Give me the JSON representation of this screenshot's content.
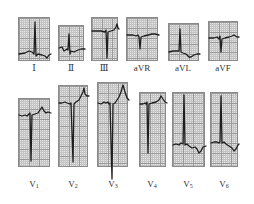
{
  "figure": {
    "title": "",
    "colors": {
      "background": "#ffffff",
      "grid_paper": "#e4e4e4",
      "grid_major": "#9a9a9a",
      "trace": "#1e1e1e",
      "label": "#333333"
    },
    "limb_leads": [
      {
        "id": "I",
        "label": "Ⅰ"
      },
      {
        "id": "II",
        "label": "Ⅱ"
      },
      {
        "id": "III",
        "label": "Ⅲ"
      },
      {
        "id": "aVR",
        "label": "aVR"
      },
      {
        "id": "aVL",
        "label": "aVL"
      },
      {
        "id": "aVF",
        "label": "aVF"
      }
    ],
    "chest_leads": [
      {
        "id": "V1",
        "label": "V",
        "sub": "1"
      },
      {
        "id": "V2",
        "label": "V",
        "sub": "2"
      },
      {
        "id": "V3",
        "label": "V",
        "sub": "3"
      },
      {
        "id": "V4",
        "label": "V",
        "sub": "4"
      },
      {
        "id": "V5",
        "label": "V",
        "sub": "5"
      },
      {
        "id": "V6",
        "label": "V",
        "sub": "6"
      }
    ]
  }
}
